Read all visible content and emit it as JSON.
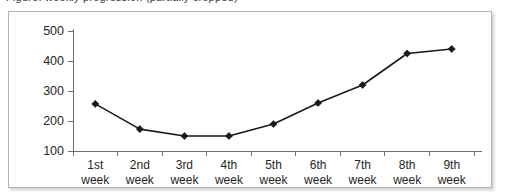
{
  "caption": {
    "text": "Figure: weekly progression (partially cropped)"
  },
  "colors": {
    "line": "#1a1a1a",
    "marker": "#1a1a1a",
    "axis": "#6e6e6e",
    "frame_border": "#b4b4b4",
    "background": "#ffffff",
    "text": "#262626"
  },
  "chart_data": {
    "type": "line",
    "title": "",
    "xlabel": "",
    "ylabel": "",
    "categories": [
      "1st week",
      "2nd week",
      "3rd week",
      "4th week",
      "5th week",
      "6th week",
      "7th week",
      "8th week",
      "9th week"
    ],
    "category_lines": [
      [
        "1st",
        "week"
      ],
      [
        "2nd",
        "week"
      ],
      [
        "3rd",
        "week"
      ],
      [
        "4th",
        "week"
      ],
      [
        "5th",
        "week"
      ],
      [
        "6th",
        "week"
      ],
      [
        "7th",
        "week"
      ],
      [
        "8th",
        "week"
      ],
      [
        "9th",
        "week"
      ]
    ],
    "values": [
      257,
      173,
      150,
      150,
      190,
      260,
      320,
      425,
      440
    ],
    "ylim": [
      100,
      500
    ],
    "yticks": [
      100,
      200,
      300,
      400,
      500
    ],
    "ytick_labels": [
      "100",
      "200",
      "300",
      "400",
      "500"
    ],
    "grid": false,
    "legend": false,
    "marker": "diamond"
  }
}
